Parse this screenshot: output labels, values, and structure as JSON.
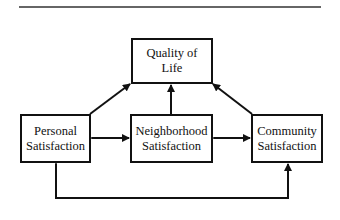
{
  "diagram": {
    "nodes": {
      "quality_of_life": {
        "line1": "Quality of",
        "line2": "Life"
      },
      "personal": {
        "line1": "Personal",
        "line2": "Satisfaction"
      },
      "neighborhood": {
        "line1": "Neighborhood",
        "line2": "Satisfaction"
      },
      "community": {
        "line1": "Community",
        "line2": "Satisfaction"
      }
    },
    "edges": [
      {
        "from": "personal",
        "to": "quality_of_life",
        "type": "directed"
      },
      {
        "from": "neighborhood",
        "to": "quality_of_life",
        "type": "directed"
      },
      {
        "from": "community",
        "to": "quality_of_life",
        "type": "directed"
      },
      {
        "from": "personal",
        "to": "neighborhood",
        "type": "bidirectional"
      },
      {
        "from": "neighborhood",
        "to": "community",
        "type": "bidirectional"
      },
      {
        "from": "personal",
        "to": "community",
        "type": "bidirectional",
        "route": "below"
      }
    ],
    "colors": {
      "stroke": "#111111",
      "background": "#ffffff"
    }
  }
}
